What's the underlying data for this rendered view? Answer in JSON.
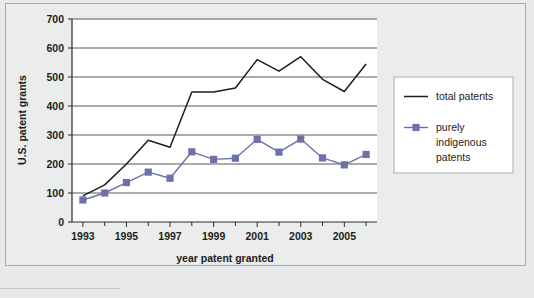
{
  "chart_data": {
    "type": "line",
    "title": "",
    "subtitle": "",
    "xlabel": "year patent granted",
    "ylabel": "U.S. patent grants",
    "x": [
      1993,
      1994,
      1995,
      1996,
      1997,
      1998,
      1999,
      2000,
      2001,
      2002,
      2003,
      2004,
      2005,
      2006
    ],
    "xlim": [
      1992.5,
      2006.5
    ],
    "ylim": [
      0,
      700
    ],
    "ytick_values": [
      0,
      100,
      200,
      300,
      400,
      500,
      600,
      700
    ],
    "ytick_labels": [
      "0",
      "100",
      "200",
      "300",
      "400",
      "500",
      "600",
      "700"
    ],
    "xtick_values": [
      1993,
      1995,
      1997,
      1999,
      2001,
      2003,
      2005
    ],
    "xtick_labels": [
      "1993",
      "1995",
      "1997",
      "1999",
      "2001",
      "2003",
      "2005"
    ],
    "xtick_minor_values": [
      1994,
      1996,
      1998,
      2000,
      2002,
      2004,
      2006
    ],
    "grid": "horizontal",
    "legend_position": "right",
    "series": [
      {
        "name": "total patents",
        "marker": "none",
        "color": "#1d1d1d",
        "values": [
          90,
          128,
          200,
          282,
          258,
          448,
          448,
          462,
          560,
          520,
          570,
          492,
          450,
          545
        ]
      },
      {
        "name": "purely indigenous patents",
        "marker": "square",
        "color": "#6d71a8",
        "values": [
          76,
          100,
          136,
          172,
          151,
          242,
          216,
          220,
          285,
          241,
          286,
          221,
          197,
          233
        ]
      }
    ]
  },
  "legend": {
    "entries": [
      {
        "label": "total patents",
        "lines": [
          "total patents"
        ]
      },
      {
        "label": "purely indigenous patents",
        "lines": [
          "purely",
          "indigenous",
          "patents"
        ]
      }
    ]
  },
  "colors": {
    "series_total": "#1d1d1d",
    "series_indigenous": "#6d71a8",
    "gridline": "#58595b",
    "axis": "#2b2b2b",
    "page_background": "#e8e9ea",
    "panel_background": "#ebecec",
    "panel_border": "#a9abad",
    "legend_background": "#ffffff"
  }
}
